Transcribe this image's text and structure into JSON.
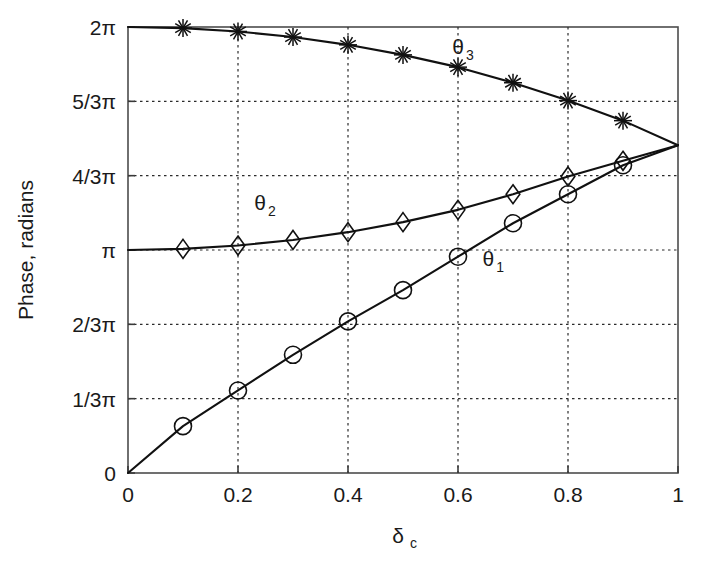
{
  "chart_data": {
    "type": "line",
    "title": "",
    "xlabel": "δc",
    "xlabel_base": "δ",
    "xlabel_sub": "c",
    "ylabel": "Phase, radians",
    "xlim": [
      0,
      1
    ],
    "ylim": [
      0,
      6.283185307
    ],
    "grid": true,
    "legend_position": "inline-annotations",
    "x_tick_labels": [
      "0",
      "0.2",
      "0.4",
      "0.6",
      "0.8",
      "1"
    ],
    "x_tick_values": [
      0,
      0.2,
      0.4,
      0.6,
      0.8,
      1
    ],
    "y_tick_labels": [
      "0",
      "1/3π",
      "2/3π",
      "π",
      "4/3π",
      "5/3π",
      "2π"
    ],
    "y_tick_values": [
      0,
      1.047197551,
      2.094395102,
      3.141592654,
      4.188790205,
      5.235987756,
      6.283185307
    ],
    "y_units": "radians (multiples of pi)",
    "x": [
      0,
      0.1,
      0.2,
      0.3,
      0.4,
      0.5,
      0.6,
      0.7,
      0.8,
      0.9,
      1.0
    ],
    "series": [
      {
        "name": "θ1",
        "label": "θ",
        "label_sub": "1",
        "marker": "circle",
        "color": "#111111",
        "values_pi": [
          0.0,
          0.21,
          0.37,
          0.53,
          0.68,
          0.82,
          0.97,
          1.12,
          1.25,
          1.38,
          1.47
        ],
        "values": [
          0.0,
          0.6597,
          1.1624,
          1.665,
          2.1363,
          2.5761,
          3.0474,
          3.5186,
          3.927,
          4.3354,
          4.6181
        ]
      },
      {
        "name": "θ2",
        "label": "θ",
        "label_sub": "2",
        "marker": "diamond",
        "color": "#111111",
        "values_pi": [
          1.0,
          1.005,
          1.02,
          1.045,
          1.08,
          1.125,
          1.18,
          1.25,
          1.33,
          1.4,
          1.47
        ],
        "values": [
          3.1416,
          3.1573,
          3.2044,
          3.283,
          3.3929,
          3.5343,
          3.7071,
          3.927,
          4.1783,
          4.3982,
          4.6181
        ]
      },
      {
        "name": "θ3",
        "label": "θ",
        "label_sub": "3",
        "marker": "star",
        "color": "#111111",
        "values_pi": [
          2.0,
          1.995,
          1.98,
          1.955,
          1.92,
          1.875,
          1.82,
          1.75,
          1.67,
          1.58,
          1.47
        ],
        "values": [
          6.2832,
          6.2675,
          6.2204,
          6.1418,
          6.0319,
          5.8905,
          5.7177,
          5.4978,
          5.2465,
          4.9637,
          4.6181
        ]
      }
    ],
    "annotations": [
      {
        "text": "θ3",
        "base": "θ",
        "sub": "3",
        "x": 0.6,
        "y_pi": 1.88
      },
      {
        "text": "θ2",
        "base": "θ",
        "sub": "2",
        "x": 0.24,
        "y_pi": 1.18
      },
      {
        "text": "θ1",
        "base": "θ",
        "sub": "1",
        "x": 0.655,
        "y_pi": 0.93
      }
    ],
    "convergence_point": {
      "x": 1.0,
      "y_pi": 1.47
    }
  }
}
